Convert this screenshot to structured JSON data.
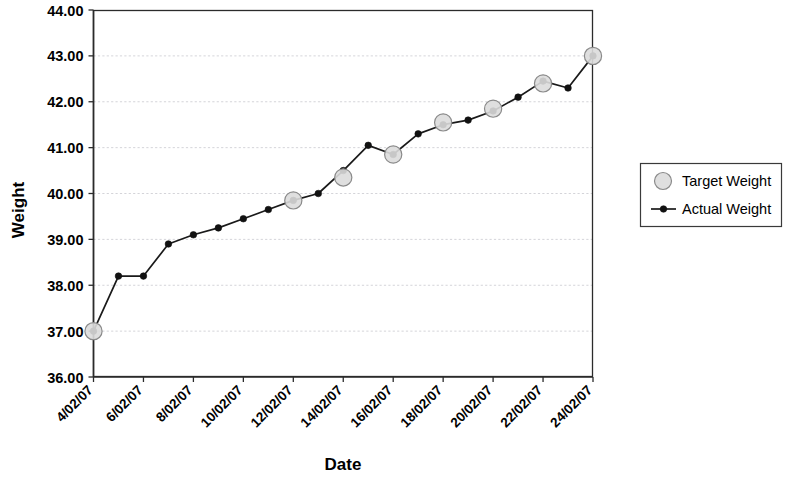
{
  "chart_data": {
    "type": "line",
    "title": "",
    "xlabel": "Date",
    "ylabel": "Weight",
    "ylim": [
      36.0,
      44.0
    ],
    "ytick_step": 1.0,
    "ytick_labels": [
      "36.00",
      "37.00",
      "38.00",
      "39.00",
      "40.00",
      "41.00",
      "42.00",
      "43.00",
      "44.00"
    ],
    "ytick_values": [
      36.0,
      37.0,
      38.0,
      39.0,
      40.0,
      41.0,
      42.0,
      43.0,
      44.0
    ],
    "grid": true,
    "grid_axis": "y",
    "legend_position": "right",
    "x": [
      "4/02/07",
      "5/02/07",
      "6/02/07",
      "7/02/07",
      "8/02/07",
      "9/02/07",
      "10/02/07",
      "11/02/07",
      "12/02/07",
      "13/02/07",
      "14/02/07",
      "15/02/07",
      "16/02/07",
      "17/02/07",
      "18/02/07",
      "19/02/07",
      "20/02/07",
      "21/02/07",
      "22/02/07",
      "23/02/07",
      "24/02/07"
    ],
    "xtick_labels": [
      "4/02/07",
      "6/02/07",
      "8/02/07",
      "10/02/07",
      "12/02/07",
      "14/02/07",
      "16/02/07",
      "18/02/07",
      "20/02/07",
      "22/02/07",
      "24/02/07"
    ],
    "xtick_indices": [
      0,
      2,
      4,
      6,
      8,
      10,
      12,
      14,
      16,
      18,
      20
    ],
    "xtick_rotation": -45,
    "series": [
      {
        "name": "Target Weight",
        "marker": "circle-gray-large",
        "line": false,
        "color": "#dcdcdc",
        "edge_color": "#8a8a8a",
        "points": [
          {
            "index": 0,
            "x": "4/02/07",
            "value": 37.0
          },
          {
            "index": 8,
            "x": "12/02/07",
            "value": 39.85
          },
          {
            "index": 10,
            "x": "14/02/07",
            "value": 40.35
          },
          {
            "index": 12,
            "x": "16/02/07",
            "value": 40.85
          },
          {
            "index": 14,
            "x": "18/02/07",
            "value": 41.55
          },
          {
            "index": 16,
            "x": "20/02/07",
            "value": 41.85
          },
          {
            "index": 18,
            "x": "22/02/07",
            "value": 42.4
          },
          {
            "index": 20,
            "x": "24/02/07",
            "value": 43.0
          }
        ]
      },
      {
        "name": "Actual Weight",
        "marker": "dot-black-small",
        "line": true,
        "color": "#1a1a1a",
        "values": [
          37.0,
          38.2,
          38.2,
          38.9,
          39.1,
          39.25,
          39.45,
          39.65,
          39.85,
          40.0,
          40.5,
          41.05,
          40.85,
          41.3,
          41.5,
          41.6,
          41.8,
          42.1,
          42.45,
          42.3,
          43.0
        ]
      }
    ]
  },
  "legend": {
    "entries": [
      {
        "label": "Target Weight",
        "type": "marker"
      },
      {
        "label": "Actual Weight",
        "type": "line-marker"
      }
    ]
  },
  "colors": {
    "grid": "#c9c9cf",
    "axis": "#2b2b2b",
    "actual": "#1a1a1a",
    "target_fill": "#dcdcdc",
    "target_edge": "#8a8a8a",
    "background": "#ffffff"
  }
}
